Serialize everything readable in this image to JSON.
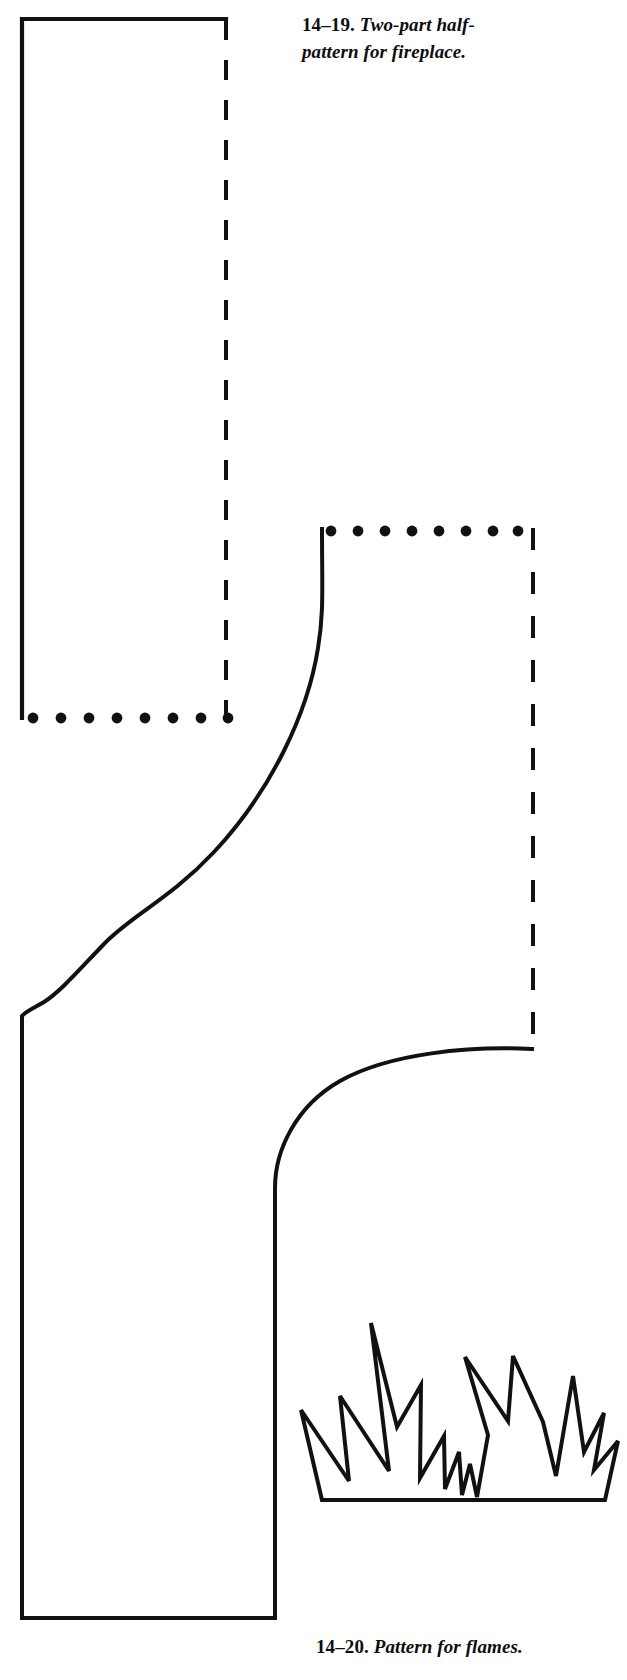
{
  "page": {
    "background_color": "#ffffff",
    "ink_color": "#111111",
    "width": 627,
    "height": 1680
  },
  "figures": [
    {
      "id": "fireplace",
      "number": "14–19.",
      "caption_text": "Two-part half-pattern for fireplace.",
      "description": "Two-part half-pattern outline for a fireplace surround, drawn with solid cut lines, dashed fold/center lines and dotted join lines."
    },
    {
      "id": "flames",
      "number": "14–20.",
      "caption_text": "Pattern for flames.",
      "description": "Silhouette outline pattern of stylized flames rising from a flat base."
    }
  ],
  "captions": {
    "fireplace": {
      "number": "14–19.",
      "text": "Two-part half-pattern for fireplace."
    },
    "flames": {
      "number": "14–20.",
      "text": "Pattern for flames."
    }
  },
  "line_styles": {
    "solid": "solid cutting line",
    "dashed": "dashed fold line",
    "dotted": "dotted placement line"
  },
  "drawing": {
    "upper_panel": {
      "solid_left_edge": {
        "x": 22,
        "y1": 18,
        "y2": 718
      },
      "solid_top_edge": {
        "y": 18,
        "x1": 22,
        "x2": 226
      },
      "dashed_right_edge": {
        "x": 226,
        "y1": 18,
        "y2": 716
      },
      "dotted_bottom_edge": {
        "y": 718,
        "x1": 30,
        "x2": 228,
        "dot_count": 8
      }
    },
    "lower_panel": {
      "dotted_top_edge": {
        "y": 531,
        "x1": 330,
        "x2": 517,
        "dot_count": 8
      },
      "dashed_right_edge": {
        "x": 533,
        "y1": 531,
        "y2": 1050
      },
      "s_curve_start": {
        "x": 323,
        "y": 530
      },
      "s_curve_end": {
        "x": 22,
        "y": 1015
      },
      "outer_left_edge": {
        "x": 22,
        "y1": 1015,
        "y2": 1618
      },
      "bottom_edge": {
        "y": 1618,
        "x1": 22,
        "x2": 275
      },
      "inner_right_edge": {
        "x": 275,
        "y1": 1188,
        "y2": 1618
      },
      "inner_curve_start": {
        "x": 533,
        "y": 1050
      },
      "inner_curve_end": {
        "x": 275,
        "y": 1188
      }
    },
    "flames": {
      "bounds": {
        "x": 300,
        "y": 1278,
        "width": 272,
        "height": 222
      },
      "peak_count": 6,
      "base_y": 1500
    }
  }
}
